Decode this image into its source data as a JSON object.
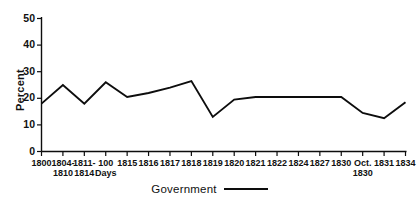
{
  "chart_data": {
    "type": "line",
    "title": "",
    "xlabel": "",
    "ylabel": "Percent",
    "ylim": [
      0,
      50
    ],
    "yticks": [
      0,
      10,
      20,
      30,
      40,
      50
    ],
    "grid": false,
    "legend_position": "bottom-center",
    "categories": [
      "1800",
      "1804-1810",
      "1811-1814",
      "100 Days",
      "1815",
      "1816",
      "1817",
      "1818",
      "1819",
      "1820",
      "1821",
      "1822",
      "1824",
      "1827",
      "1830",
      "Oct. 1830",
      "1831",
      "1834"
    ],
    "category_lines": [
      [
        "1800",
        ""
      ],
      [
        "1804-",
        "1810"
      ],
      [
        "1811-",
        "1814"
      ],
      [
        "100",
        "Days"
      ],
      [
        "1815",
        ""
      ],
      [
        "1816",
        ""
      ],
      [
        "1817",
        ""
      ],
      [
        "1818",
        ""
      ],
      [
        "1819",
        ""
      ],
      [
        "1820",
        ""
      ],
      [
        "1821",
        ""
      ],
      [
        "1822",
        ""
      ],
      [
        "1824",
        ""
      ],
      [
        "1827",
        ""
      ],
      [
        "1830",
        ""
      ],
      [
        "Oct.",
        "1830"
      ],
      [
        "1831",
        ""
      ],
      [
        "1834",
        ""
      ]
    ],
    "series": [
      {
        "name": "Government",
        "color": "#0d0d0d",
        "values": [
          18,
          25,
          18,
          26,
          20.5,
          22,
          24,
          26.5,
          13,
          19.5,
          20.5,
          20.5,
          20.5,
          20.5,
          20.5,
          14.5,
          12.5,
          18.5
        ]
      }
    ],
    "legend": [
      {
        "label": "Government",
        "color": "#0d0d0d"
      }
    ]
  },
  "axis": {
    "y_label": "Percent",
    "y_tick_labels": [
      "50",
      "40",
      "30",
      "20",
      "10",
      "0"
    ]
  },
  "legend": {
    "series_label": "Government"
  },
  "colors": {
    "ink": "#0d0d0d",
    "background": "#ffffff"
  }
}
